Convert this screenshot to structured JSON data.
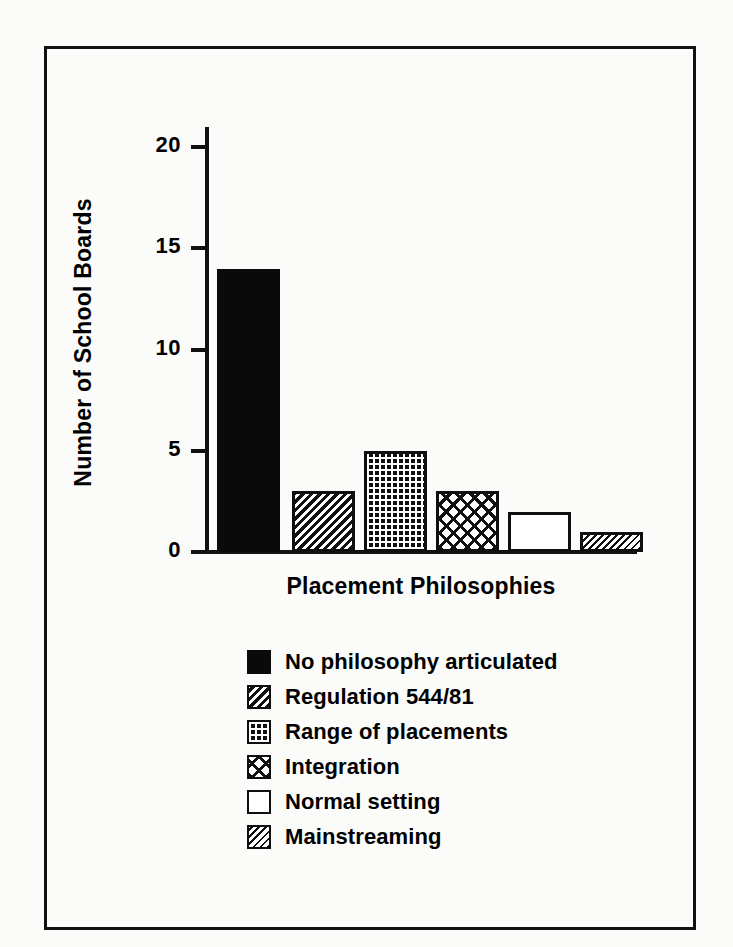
{
  "chart_data": {
    "type": "bar",
    "title": "",
    "xlabel": "Placement Philosophies",
    "ylabel": "Number of School Boards",
    "categories": [
      "No philosophy articulated",
      "Regulation 544/81",
      "Range of placements",
      "Integration",
      "Normal setting",
      "Mainstreaming"
    ],
    "values": [
      14,
      3,
      5,
      3,
      2,
      1
    ],
    "ylim": [
      0,
      21
    ],
    "yticks": [
      0,
      5,
      10,
      15,
      20
    ],
    "ytick_labels": [
      "0",
      "5",
      "10",
      "15",
      "20"
    ],
    "grid": false,
    "legend_position": "below-axes",
    "series": [
      {
        "name": "Number of School Boards",
        "values": [
          14,
          3,
          5,
          3,
          2,
          1
        ]
      }
    ],
    "bar_fills": [
      "solid-black",
      "diagonal-hatch",
      "fine-grid",
      "cross-dash",
      "empty-white",
      "tight-diagonal-hatch"
    ]
  },
  "axes": {
    "y_title": "Number of School Boards",
    "x_title": "Placement Philosophies",
    "y_ticks": [
      {
        "label": "20",
        "value": 20
      },
      {
        "label": "15",
        "value": 15
      },
      {
        "label": "10",
        "value": 10
      },
      {
        "label": "5",
        "value": 5
      },
      {
        "label": "0",
        "value": 0
      }
    ]
  },
  "bars": [
    {
      "label": "No philosophy articulated",
      "value": 14,
      "fill": "solid-black"
    },
    {
      "label": "Regulation 544/81",
      "value": 3,
      "fill": "diagonal-hatch"
    },
    {
      "label": "Range of placements",
      "value": 5,
      "fill": "fine-grid"
    },
    {
      "label": "Integration",
      "value": 3,
      "fill": "cross-dash"
    },
    {
      "label": "Normal setting",
      "value": 2,
      "fill": "empty-white"
    },
    {
      "label": "Mainstreaming",
      "value": 1,
      "fill": "tight-diagonal-hatch"
    }
  ],
  "legend": {
    "items": [
      {
        "label": "No philosophy articulated",
        "fill": "solid-black"
      },
      {
        "label": "Regulation 544/81",
        "fill": "diagonal-hatch"
      },
      {
        "label": "Range of placements",
        "fill": "fine-grid"
      },
      {
        "label": "Integration",
        "fill": "cross-dash"
      },
      {
        "label": "Normal setting",
        "fill": "empty-white"
      },
      {
        "label": "Mainstreaming",
        "fill": "tight-diagonal-hatch"
      }
    ]
  },
  "colors": {
    "ink": "#111111",
    "paper": "#fbfbfa",
    "bar_solid": "#0a0a0a"
  }
}
